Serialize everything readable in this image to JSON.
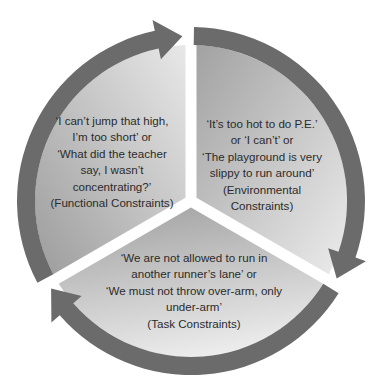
{
  "diagram": {
    "type": "cycle",
    "segments": [
      {
        "id": "functional",
        "lines": [
          "‘I can’t jump that high,",
          "I’m too short’ or",
          "‘What did the teacher",
          "say, I wasn’t",
          "concentrating?’",
          "(Functional Constraints)"
        ],
        "category": "Functional Constraints"
      },
      {
        "id": "environmental",
        "lines": [
          "‘It’s too hot to do P.E.’",
          "or ‘I can’t’ or",
          "‘The playground is very",
          "slippy to run around’",
          "(Environmental",
          "Constraints)"
        ],
        "category": "Environmental Constraints"
      },
      {
        "id": "task",
        "lines": [
          "‘We are not allowed to run in",
          "another runner’s lane’ or",
          "‘We must not throw over-arm, only",
          "under-arm’",
          "(Task Constraints)"
        ],
        "category": "Task Constraints"
      }
    ],
    "arrow_direction": "clockwise",
    "colors": {
      "arrow": "#6b6b6b",
      "wedge_dark": "#9a9a9a",
      "wedge_light": "#e6e6e6",
      "text": "#2b2b2b",
      "background": "#ffffff"
    }
  }
}
